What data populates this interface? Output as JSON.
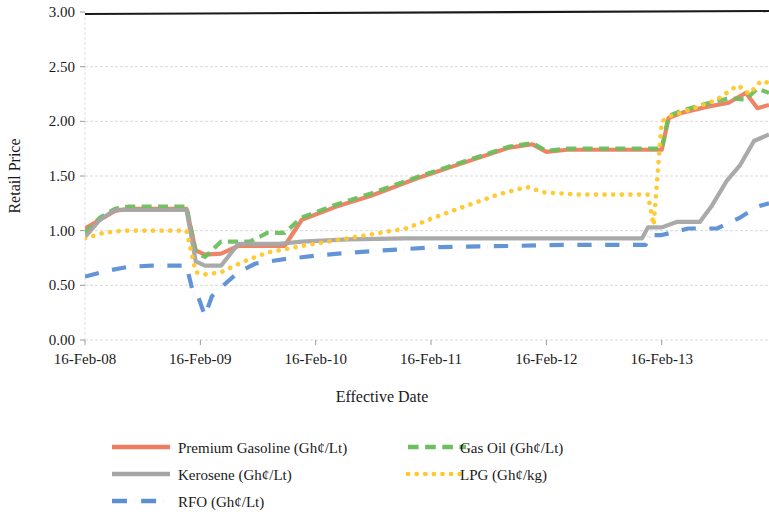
{
  "chart_data": {
    "type": "line",
    "title": "",
    "xlabel": "Effective Date",
    "ylabel": "Retail Price",
    "ylim": [
      0.0,
      3.0
    ],
    "yticks": [
      "0.00",
      "0.50",
      "1.00",
      "1.50",
      "2.00",
      "2.50",
      "3.00"
    ],
    "ytick_values": [
      0.0,
      0.5,
      1.0,
      1.5,
      2.0,
      2.5,
      3.0
    ],
    "xticks": [
      "16-Feb-08",
      "16-Feb-09",
      "16-Feb-10",
      "16-Feb-11",
      "16-Feb-12",
      "16-Feb-13"
    ],
    "xtick_values": [
      2008.12,
      2009.12,
      2010.12,
      2011.12,
      2012.12,
      2013.12
    ],
    "xlim": [
      2008.12,
      2014.05
    ],
    "grid": true,
    "grid_axis": "y",
    "legend_position": "bottom",
    "series": [
      {
        "name": "Premium Gasoline (Gh¢/Lt)",
        "color": "#ED7D5F",
        "dash": "solid",
        "x": [
          2008.12,
          2008.25,
          2008.38,
          2008.5,
          2008.62,
          2008.75,
          2008.88,
          2009.0,
          2009.08,
          2009.16,
          2009.3,
          2009.45,
          2009.55,
          2009.7,
          2009.85,
          2010.0,
          2010.3,
          2010.6,
          2011.0,
          2011.4,
          2011.8,
          2012.0,
          2012.12,
          2012.3,
          2012.6,
          2013.0,
          2013.12,
          2013.18,
          2013.3,
          2013.5,
          2013.7,
          2013.85,
          2013.95,
          2014.05
        ],
        "y": [
          1.02,
          1.1,
          1.18,
          1.2,
          1.2,
          1.2,
          1.2,
          1.2,
          0.82,
          0.78,
          0.79,
          0.86,
          0.86,
          0.86,
          0.86,
          1.1,
          1.22,
          1.32,
          1.48,
          1.62,
          1.76,
          1.79,
          1.72,
          1.74,
          1.74,
          1.74,
          1.74,
          2.03,
          2.08,
          2.13,
          2.17,
          2.26,
          2.12,
          2.15
        ]
      },
      {
        "name": "Gas Oil (Gh¢/Lt)",
        "color": "#6CBF5E",
        "dash": "dashed",
        "x": [
          2008.12,
          2008.25,
          2008.38,
          2008.5,
          2008.62,
          2008.75,
          2008.88,
          2009.0,
          2009.08,
          2009.16,
          2009.3,
          2009.45,
          2009.55,
          2009.7,
          2009.85,
          2010.0,
          2010.3,
          2010.6,
          2011.0,
          2011.4,
          2011.8,
          2012.0,
          2012.12,
          2012.3,
          2012.6,
          2013.0,
          2013.12,
          2013.18,
          2013.3,
          2013.5,
          2013.7,
          2013.85,
          2013.95,
          2014.05
        ],
        "y": [
          0.98,
          1.12,
          1.2,
          1.22,
          1.22,
          1.22,
          1.22,
          1.22,
          0.8,
          0.76,
          0.9,
          0.9,
          0.9,
          0.98,
          0.98,
          1.12,
          1.24,
          1.34,
          1.49,
          1.63,
          1.77,
          1.8,
          1.73,
          1.75,
          1.75,
          1.75,
          1.75,
          2.05,
          2.1,
          2.16,
          2.21,
          2.2,
          2.3,
          2.26
        ]
      },
      {
        "name": "Kerosene (Gh¢/Lt)",
        "color": "#A5A5A5",
        "dash": "solid",
        "x": [
          2008.12,
          2008.25,
          2008.38,
          2008.5,
          2008.62,
          2008.75,
          2008.88,
          2009.0,
          2009.08,
          2009.16,
          2009.3,
          2009.45,
          2009.6,
          2009.8,
          2010.0,
          2010.4,
          2010.9,
          2011.4,
          2012.0,
          2012.6,
          2012.95,
          2013.0,
          2013.12,
          2013.25,
          2013.45,
          2013.55,
          2013.68,
          2013.8,
          2013.92,
          2014.05
        ],
        "y": [
          0.94,
          1.1,
          1.19,
          1.19,
          1.19,
          1.19,
          1.19,
          1.19,
          0.72,
          0.68,
          0.68,
          0.88,
          0.88,
          0.88,
          0.9,
          0.92,
          0.93,
          0.93,
          0.93,
          0.93,
          0.93,
          1.03,
          1.03,
          1.08,
          1.08,
          1.22,
          1.45,
          1.6,
          1.82,
          1.88
        ]
      },
      {
        "name": "LPG (Gh¢/kg)",
        "color": "#FFC829",
        "dash": "dotted",
        "x": [
          2008.12,
          2008.28,
          2008.45,
          2008.7,
          2008.9,
          2009.0,
          2009.08,
          2009.16,
          2009.3,
          2009.5,
          2009.7,
          2010.0,
          2010.4,
          2010.9,
          2011.3,
          2011.7,
          2011.95,
          2012.1,
          2012.4,
          2012.8,
          2013.0,
          2013.05,
          2013.12,
          2013.2,
          2013.4,
          2013.6,
          2013.78,
          2013.88,
          2013.98,
          2014.05
        ],
        "y": [
          0.93,
          0.98,
          1.0,
          1.0,
          1.0,
          1.0,
          0.62,
          0.6,
          0.62,
          0.72,
          0.8,
          0.86,
          0.93,
          1.02,
          1.18,
          1.33,
          1.4,
          1.35,
          1.33,
          1.33,
          1.33,
          1.05,
          2.0,
          2.05,
          2.12,
          2.2,
          2.33,
          2.25,
          2.37,
          2.35
        ]
      },
      {
        "name": "RFO (Gh¢/Lt)",
        "color": "#5B8FD4",
        "dash": "dashdot",
        "x": [
          2008.12,
          2008.3,
          2008.5,
          2008.7,
          2008.9,
          2009.0,
          2009.06,
          2009.1,
          2009.16,
          2009.22,
          2009.32,
          2009.45,
          2009.6,
          2009.85,
          2010.2,
          2010.7,
          2011.2,
          2011.8,
          2012.3,
          2012.8,
          2012.98,
          2013.02,
          2013.12,
          2013.35,
          2013.6,
          2013.8,
          2013.95,
          2014.05
        ],
        "y": [
          0.58,
          0.63,
          0.67,
          0.68,
          0.68,
          0.68,
          0.42,
          0.4,
          0.22,
          0.4,
          0.5,
          0.62,
          0.7,
          0.74,
          0.78,
          0.82,
          0.85,
          0.86,
          0.87,
          0.87,
          0.87,
          0.96,
          0.96,
          1.02,
          1.02,
          1.12,
          1.22,
          1.25
        ]
      }
    ]
  },
  "legend": {
    "items": [
      {
        "label": "Premium Gasoline (Gh¢/Lt)",
        "color": "#ED7D5F",
        "dash": "solid"
      },
      {
        "label": "Gas Oil (Gh¢/Lt)",
        "color": "#6CBF5E",
        "dash": "dashed"
      },
      {
        "label": "Kerosene (Gh¢/Lt)",
        "color": "#A5A5A5",
        "dash": "solid"
      },
      {
        "label": "LPG (Gh¢/kg)",
        "color": "#FFC829",
        "dash": "dotted"
      },
      {
        "label": "RFO (Gh¢/Lt)",
        "color": "#5B8FD4",
        "dash": "dashdot"
      }
    ]
  },
  "style": {
    "plot_bg": "#ffffff",
    "grid_color": "#d9d9d9",
    "top_border_color": "#1a1a1a",
    "text_color": "#1a1a1a"
  }
}
